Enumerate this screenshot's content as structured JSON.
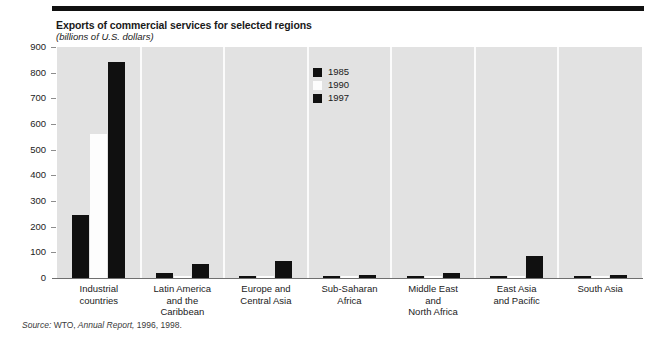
{
  "chart_data": {
    "type": "bar",
    "title": "Exports of commercial services for selected regions",
    "subtitle": "(billions of U.S. dollars)",
    "xlabel": "",
    "ylabel": "",
    "ylim": [
      0,
      900
    ],
    "yticks": [
      0,
      100,
      200,
      300,
      400,
      500,
      600,
      700,
      800,
      900
    ],
    "ytick_labels": [
      "0",
      "100",
      "200",
      "300",
      "400",
      "500",
      "600",
      "700",
      "800",
      "900"
    ],
    "grid": false,
    "legend_position": "inside-top-center",
    "categories": [
      "Industrial countries",
      "Latin America and the Caribbean",
      "Europe and Central Asia",
      "Sub-Saharan Africa",
      "Middle East and North Africa",
      "East Asia and Pacific",
      "South Asia"
    ],
    "category_lines": [
      [
        "Industrial",
        "countries"
      ],
      [
        "Latin America",
        "and the",
        "Caribbean"
      ],
      [
        "Europe and",
        "Central Asia"
      ],
      [
        "Sub-Saharan",
        "Africa"
      ],
      [
        "Middle East",
        "and",
        "North Africa"
      ],
      [
        "East Asia",
        "and Pacific"
      ],
      [
        "South Asia"
      ]
    ],
    "series": [
      {
        "name": "1985",
        "color": "#101010",
        "values": [
          247,
          20,
          9,
          6,
          7,
          9,
          3
        ]
      },
      {
        "name": "1990",
        "color": "#fdfdfd",
        "values": [
          560,
          6,
          4,
          3,
          4,
          4,
          2
        ]
      },
      {
        "name": "1997",
        "color": "#101010",
        "values": [
          840,
          55,
          66,
          12,
          18,
          86,
          11
        ]
      }
    ],
    "source": {
      "prefix": "Source:",
      "publisher": "WTO,",
      "work": "Annual Report,",
      "years": "1996, 1998."
    }
  },
  "style": {
    "plot_background": "#e2e2e2",
    "panel_separator": "#fbfbfb",
    "axis_color": "#6f6f6f",
    "rule_color": "#111111"
  }
}
